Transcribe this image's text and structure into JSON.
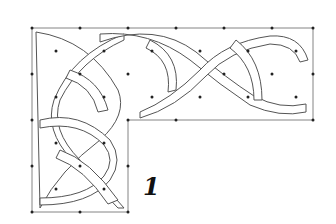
{
  "figure": {
    "label": "1",
    "colors": {
      "line": "#555555",
      "background": "#ffffff",
      "dots": "#222222"
    }
  }
}
